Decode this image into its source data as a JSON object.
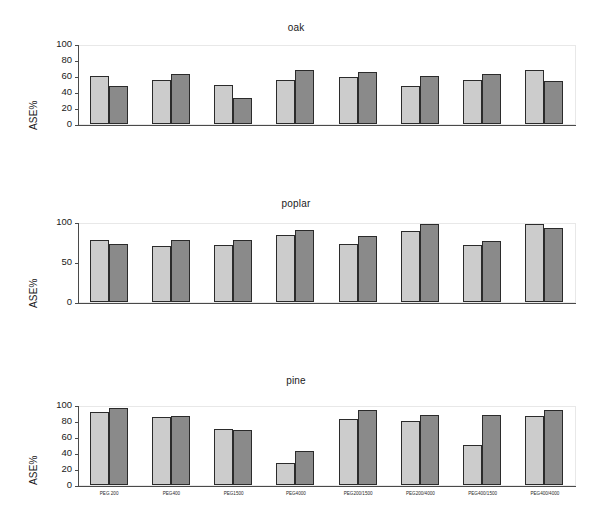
{
  "figure": {
    "background": "#ffffff",
    "bar_colors": {
      "light": "#cccccc",
      "dark": "#8a8a8a",
      "outline": "#2b2b2b"
    },
    "axis_color": "#4a4a4a",
    "ylabel": "ASE%"
  },
  "panels": [
    {
      "title": "oak"
    },
    {
      "title": "poplar"
    },
    {
      "title": "pine"
    }
  ],
  "categories": [
    "PEG 200",
    "PEG400",
    "PEG1500",
    "PEG4000",
    "PEG200/1500",
    "PEG200/4000",
    "PEG400/1500",
    "PEG400/4000"
  ],
  "yticks": {
    "oak": [
      "100",
      "80",
      "60",
      "40",
      "20",
      "0"
    ],
    "poplar": [
      "100",
      "50",
      "0"
    ],
    "pine": [
      "100",
      "80",
      "60",
      "40",
      "20",
      "0"
    ]
  },
  "chart_data": [
    {
      "type": "bar",
      "title": "oak",
      "xlabel": "",
      "ylabel": "ASE%",
      "ylim": [
        0,
        100
      ],
      "yticks": [
        0,
        20,
        40,
        60,
        80,
        100
      ],
      "grid": false,
      "legend": "none",
      "categories": [
        "PEG 200",
        "PEG400",
        "PEG1500",
        "PEG4000",
        "PEG200/1500",
        "PEG200/4000",
        "PEG400/1500",
        "PEG400/4000"
      ],
      "series": [
        {
          "name": "series-1-light",
          "color": "#cccccc",
          "values": [
            60,
            55,
            49,
            55,
            59,
            47,
            55,
            68
          ]
        },
        {
          "name": "series-2-dark",
          "color": "#8a8a8a",
          "values": [
            47,
            63,
            33,
            68,
            65,
            60,
            62,
            54
          ]
        }
      ]
    },
    {
      "type": "bar",
      "title": "poplar",
      "xlabel": "",
      "ylabel": "ASE%",
      "ylim": [
        0,
        100
      ],
      "yticks": [
        0,
        50,
        100
      ],
      "grid": false,
      "legend": "none",
      "categories": [
        "PEG 200",
        "PEG400",
        "PEG1500",
        "PEG4000",
        "PEG200/1500",
        "PEG200/4000",
        "PEG400/1500",
        "PEG400/4000"
      ],
      "series": [
        {
          "name": "series-1-light",
          "color": "#cccccc",
          "values": [
            78,
            70,
            71,
            84,
            73,
            89,
            71,
            97
          ]
        },
        {
          "name": "series-2-dark",
          "color": "#8a8a8a",
          "values": [
            73,
            77,
            77,
            90,
            83,
            97,
            76,
            93
          ]
        }
      ]
    },
    {
      "type": "bar",
      "title": "pine",
      "xlabel": "",
      "ylabel": "ASE%",
      "ylim": [
        0,
        100
      ],
      "yticks": [
        0,
        20,
        40,
        60,
        80,
        100
      ],
      "grid": false,
      "legend": "none",
      "categories": [
        "PEG 200",
        "PEG400",
        "PEG1500",
        "PEG4000",
        "PEG200/1500",
        "PEG200/4000",
        "PEG400/1500",
        "PEG400/4000"
      ],
      "series": [
        {
          "name": "series-1-light",
          "color": "#cccccc",
          "values": [
            91,
            85,
            70,
            28,
            82,
            80,
            50,
            86
          ]
        },
        {
          "name": "series-2-dark",
          "color": "#8a8a8a",
          "values": [
            96,
            86,
            69,
            42,
            94,
            88,
            87,
            94
          ]
        }
      ]
    }
  ]
}
